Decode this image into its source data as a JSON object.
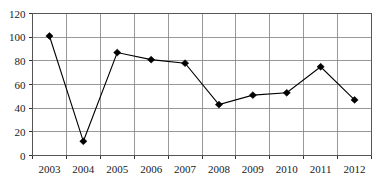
{
  "chart_data": {
    "type": "line",
    "title": "",
    "subtitle": "",
    "xlabel": "",
    "ylabel": "",
    "categories": [
      "2003",
      "2004",
      "2005",
      "2006",
      "2007",
      "2008",
      "2009",
      "2010",
      "2011",
      "2012"
    ],
    "values": [
      101,
      12,
      87,
      81,
      78,
      43,
      51,
      53,
      75,
      47
    ],
    "series": [
      {
        "name": "",
        "values": [
          101,
          12,
          87,
          81,
          78,
          43,
          51,
          53,
          75,
          47
        ]
      }
    ],
    "ylim": [
      0,
      120
    ],
    "yticks": [
      0,
      20,
      40,
      60,
      80,
      100,
      120
    ],
    "ytick_labels": [
      "0",
      "20",
      "40",
      "60",
      "80",
      "100",
      "120"
    ],
    "xtick_labels": [
      "2003",
      "2004",
      "2005",
      "2006",
      "2007",
      "2008",
      "2009",
      "2010",
      "2011",
      "2012"
    ],
    "grid": true,
    "grid_horizontal": true,
    "grid_vertical": true,
    "legend": false,
    "legend_position": "none",
    "marker": "diamond",
    "annotations": [],
    "colors": {
      "line": "#000000",
      "marker": "#000000",
      "grid": "#808080",
      "border": "#555555",
      "background": "#ffffff",
      "text": "#1a1a1a"
    }
  }
}
